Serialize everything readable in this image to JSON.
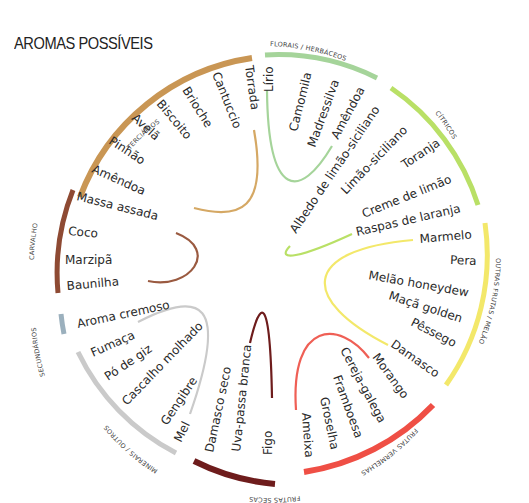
{
  "title": "AROMAS POSSÍVEIS",
  "wheel": {
    "center": [
      266,
      278
    ],
    "categories": [
      {
        "name": "TERCIÁRIOS",
        "color": "#c99654",
        "start": -82,
        "end": -25,
        "terms": [
          "Torrada",
          "Cantuccio",
          "Brioche",
          "Biscoito",
          "Avelã",
          "Pinhão",
          "Amêndoa"
        ]
      },
      {
        "name": "FLORAIS / HERBÁCEOS",
        "color": "#a5d49a",
        "start": -7,
        "end": 28,
        "terms": [
          "Lírio",
          "Camomila",
          "Madressilva",
          "Amêndoa"
        ]
      },
      {
        "name": "CÍTRICOS",
        "color": "#b9e066",
        "start": 32,
        "end": 76,
        "terms": [
          "Albedo de limão-siciliano",
          "Limão-siciliano",
          "Toranja",
          "Creme de limão",
          "Raspas de laranja"
        ]
      },
      {
        "name": "OUTRAS FRUTAS / MELÃO",
        "color": "#f3e86a",
        "start": 84,
        "end": 135,
        "terms": [
          "Marmelo",
          "Pera",
          "Melão honeydew",
          "Maçã golden",
          "Pêssego",
          "Damasco"
        ]
      },
      {
        "name": "FRUTAS VERMELHAS",
        "color": "#ef4f45",
        "start": 140,
        "end": 185,
        "terms": [
          "Morango",
          "Cereja-galega",
          "Framboesa",
          "Groselha",
          "Ameixa"
        ]
      },
      {
        "name": "FRUTAS SECAS",
        "color": "#6e1c1c",
        "start": 190,
        "end": 216,
        "terms": [
          "Damasco seco",
          "Uva-passa branca",
          "Figo"
        ]
      },
      {
        "name": "MINERAIS / OUTROS",
        "color": "#cacaca",
        "start": 221,
        "end": 277,
        "terms": [
          "Fumaça",
          "Pó de giz",
          "Cascalho molhado",
          "Gengibre",
          "Mel"
        ]
      },
      {
        "name": "SECUNDÁRIOS",
        "color": "#9bb0bd",
        "start": 281,
        "end": 287,
        "terms": [
          "Aroma cremoso"
        ]
      },
      {
        "name": "CARVALHO",
        "color": "#8e4a33",
        "start": 291,
        "end": 323,
        "terms": [
          "Massa assada",
          "Coco",
          "Marzipã",
          "Baunilha"
        ]
      }
    ]
  },
  "labels": {
    "terciarios": "TERCIÁRIOS",
    "florais": "FLORAIS / HERBÁCEOS",
    "citricos": "CÍTRICOS",
    "outras": "OUTRAS FRUTAS / MELÃO",
    "vermelhas": "FRUTAS VERMELHAS",
    "secas": "FRUTAS SECAS",
    "minerais": "MINERAIS / OUTROS",
    "secundarios": "SECUNDÁRIOS",
    "carvalho": "CARVALHO"
  },
  "terms": {
    "terciarios": [
      "Torrada",
      "Cantuccio",
      "Brioche",
      "Biscoito",
      "Avelã",
      "Pinhão",
      "Amêndoa"
    ],
    "florais": [
      "Lírio",
      "Camomila",
      "Madressilva",
      "Amêndoa"
    ],
    "citricos": [
      "Albedo de limão-siciliano",
      "Limão-siciliano",
      "Toranja",
      "Creme de limão",
      "Raspas de laranja"
    ],
    "outras": [
      "Marmelo",
      "Pera",
      "Melão honeydew",
      "Maçã golden",
      "Pêssego",
      "Damasco"
    ],
    "vermelhas": [
      "Morango",
      "Cereja-galega",
      "Framboesa",
      "Groselha",
      "Ameixa"
    ],
    "secas": [
      "Damasco seco",
      "Uva-passa branca",
      "Figo"
    ],
    "minerais": [
      "Fumaça",
      "Pó de giz",
      "Cascalho molhado",
      "Gengibre",
      "Mel"
    ],
    "secundarios": [
      "Aroma cremoso"
    ],
    "carvalho": [
      "Massa assada",
      "Coco",
      "Marzipã",
      "Baunilha"
    ]
  },
  "colors": {
    "terciarios": "#c99654",
    "florais": "#a5d49a",
    "citricos": "#b9e066",
    "outras": "#f3e86a",
    "vermelhas": "#ef4f45",
    "secas": "#6e1c1c",
    "minerais": "#cacaca",
    "secundarios": "#9bb0bd",
    "carvalho": "#8e4a33"
  }
}
